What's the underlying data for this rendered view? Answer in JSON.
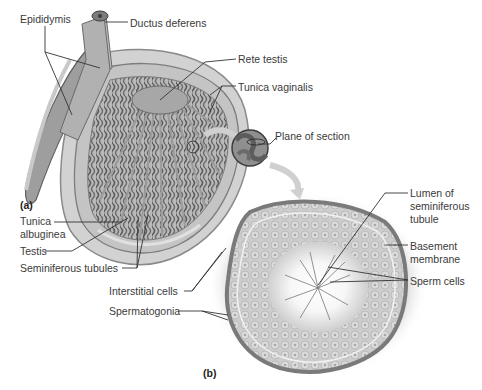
{
  "figure": {
    "panels": [
      {
        "id": "a",
        "label": "(a)"
      },
      {
        "id": "b",
        "label": "(b)"
      }
    ],
    "labels": {
      "epididymis": "Epididymis",
      "ductus_deferens": "Ductus deferens",
      "rete_testis": "Rete testis",
      "tunica_vaginalis": "Tunica vaginalis",
      "plane_of_section": "Plane of section",
      "tunica_albuginea_1": "Tunica",
      "tunica_albuginea_2": "albuginea",
      "testis": "Testis",
      "seminiferous_tubules": "Seminiferous tubules",
      "lumen_1": "Lumen of",
      "lumen_2": "seminiferous",
      "lumen_3": "tubule",
      "basement_1": "Basement",
      "basement_2": "membrane",
      "sperm_cells": "Sperm cells",
      "interstitial_cells": "Interstitial cells",
      "spermatogonia": "Spermatogonia"
    },
    "colors": {
      "tissue_dark": "#6e6e6e",
      "tissue_mid": "#9a9a9a",
      "tissue_light": "#c8c8c8",
      "membrane": "#7a7a7a",
      "leader_line": "#333333",
      "arrow": "#cfcfcf"
    }
  }
}
